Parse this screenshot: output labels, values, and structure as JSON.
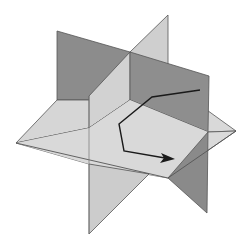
{
  "diagram": {
    "colors": {
      "background": "#ffffff",
      "light_plane": "#d8d8d8",
      "mid_plane": "#c8c8c8",
      "dark_plane": "#8a8a8a",
      "edge": "#555555",
      "path": "#1a1a1a"
    },
    "planes": [
      {
        "name": "back-dark-plane",
        "points": "57,31 130,52 130,97 57,100"
      },
      {
        "name": "horizontal-plane-back-left",
        "points": "16,143 57,100 130,97 124,131"
      },
      {
        "name": "horizontal-plane-back-right",
        "points": "130,97 168,80 236,131 208,133"
      },
      {
        "name": "diagonal-plane-upper",
        "points": "168,15 168,80 130,97 130,52"
      },
      {
        "name": "diagonal-plane-upper-left",
        "points": "130,52 130,97 89,129 89,102"
      },
      {
        "name": "front-dark-plane",
        "points": "130,52 209,76 208,133 130,97"
      },
      {
        "name": "horizontal-plane-front",
        "points": "16,143 124,131 208,133 236,131 168,178"
      },
      {
        "name": "diagonal-plane-lower",
        "points": "89,129 124,131 149,185 89,234"
      },
      {
        "name": "front-dark-plane-lower",
        "points": "208,133 207,213 168,178"
      }
    ],
    "path": {
      "points": "200,90 152,97 119,124 124,151 165,158",
      "arrow_tip": [
        175,
        159
      ]
    }
  }
}
